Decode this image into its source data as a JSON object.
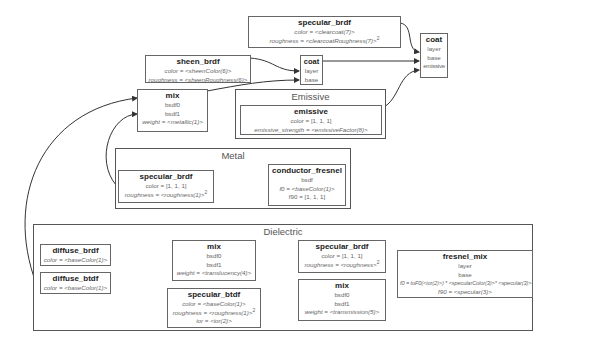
{
  "groups": {
    "emissive": {
      "label": "Emissive"
    },
    "metal": {
      "label": "Metal"
    },
    "dielectric": {
      "label": "Dielectric"
    }
  },
  "nodes": {
    "specular_brdf_clearcoat": {
      "title": "specular_brdf",
      "rows": [
        "color = <clearcoat(7)>",
        "roughness = <clearcoatRoughness(7)>"
      ],
      "superscript": "2"
    },
    "coat_main": {
      "title": "coat",
      "rows": [
        "layer",
        "base",
        "emissive"
      ]
    },
    "sheen_brdf": {
      "title": "sheen_brdf",
      "rows": [
        "color = <sheenColor(6)>",
        "roughness = <sheenRoughness(6)>"
      ]
    },
    "coat_sheen": {
      "title": "coat",
      "rows": [
        "layer",
        "base"
      ]
    },
    "mix_metallic": {
      "title": "mix",
      "rows": [
        "bsdf0",
        "bsdf1",
        "weight = <metallic(1)>"
      ]
    },
    "emissive": {
      "title": "emissive",
      "rows": [
        "color = [1, 1, 1]",
        "emissive_strength = <emissiveFactor(8)>"
      ]
    },
    "specular_brdf_metal": {
      "title": "specular_brdf",
      "rows": [
        "color = [1, 1, 1]",
        "roughness = <roughness(1)>"
      ],
      "superscript": "2"
    },
    "conductor_fresnel": {
      "title": "conductor_fresnel",
      "rows": [
        "bsdf",
        "f0 = <baseColor(1)>",
        "f90 = [1, 1, 1]"
      ]
    },
    "diffuse_brdf": {
      "title": "diffuse_brdf",
      "rows": [
        "color = <baseColor(1)>"
      ]
    },
    "diffuse_btdf": {
      "title": "diffuse_btdf",
      "rows": [
        "color = <baseColor(1)>"
      ]
    },
    "mix_translucency": {
      "title": "mix",
      "rows": [
        "bsdf0",
        "bsdf1",
        "weight = <translucency(4)>"
      ]
    },
    "specular_btdf": {
      "title": "specular_btdf",
      "rows": [
        "color = <baseColor(1)>",
        "roughness = <roughness(1)>",
        "ior = <ior(2)>"
      ],
      "superscript": "2"
    },
    "specular_brdf_dielectric": {
      "title": "specular_brdf",
      "rows": [
        "color = [1, 1, 1]",
        "roughness = <roughness>"
      ],
      "superscript": "2"
    },
    "mix_transmission": {
      "title": "mix",
      "rows": [
        "bsdf0",
        "bsdf1",
        "weight = <transmission(5)>"
      ]
    },
    "fresnel_mix": {
      "title": "fresnel_mix",
      "rows": [
        "layer",
        "base",
        "f0 = toF0(<ior(2)>) * <specularColor(3)>* <specular(3)>",
        "f90 = <specular(3)>"
      ]
    }
  },
  "colors": {
    "border": "#555555",
    "edge": "#333333",
    "text": "#666666",
    "title": "#222222"
  }
}
